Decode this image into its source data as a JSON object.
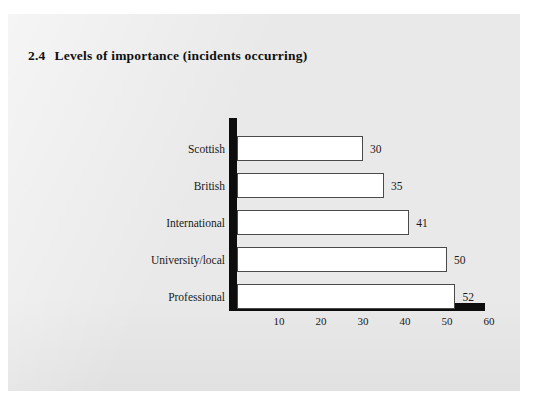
{
  "page": {
    "background_color": "#e9e9e9",
    "outer_color": "#ffffff"
  },
  "figure": {
    "number": "2.4",
    "title": "Levels of importance (incidents occurring)"
  },
  "axis": {
    "color": "#0d0d0d",
    "tick_labels": [
      "10",
      "20",
      "30",
      "40",
      "50",
      "60"
    ]
  },
  "chart_data": {
    "type": "bar",
    "orientation": "horizontal",
    "xlabel": "",
    "ylabel": "",
    "categories": [
      "Scottish",
      "British",
      "International",
      "University/local",
      "Professional"
    ],
    "values": [
      30,
      35,
      41,
      50,
      52
    ],
    "data_labels": [
      "30",
      "35",
      "41",
      "50",
      "52"
    ],
    "xlim": [
      0,
      60
    ],
    "xticks": [
      10,
      20,
      30,
      40,
      50,
      60
    ],
    "grid": false,
    "legend": false,
    "bar_fill": "#ffffff",
    "bar_border": "#4a4a4a"
  }
}
